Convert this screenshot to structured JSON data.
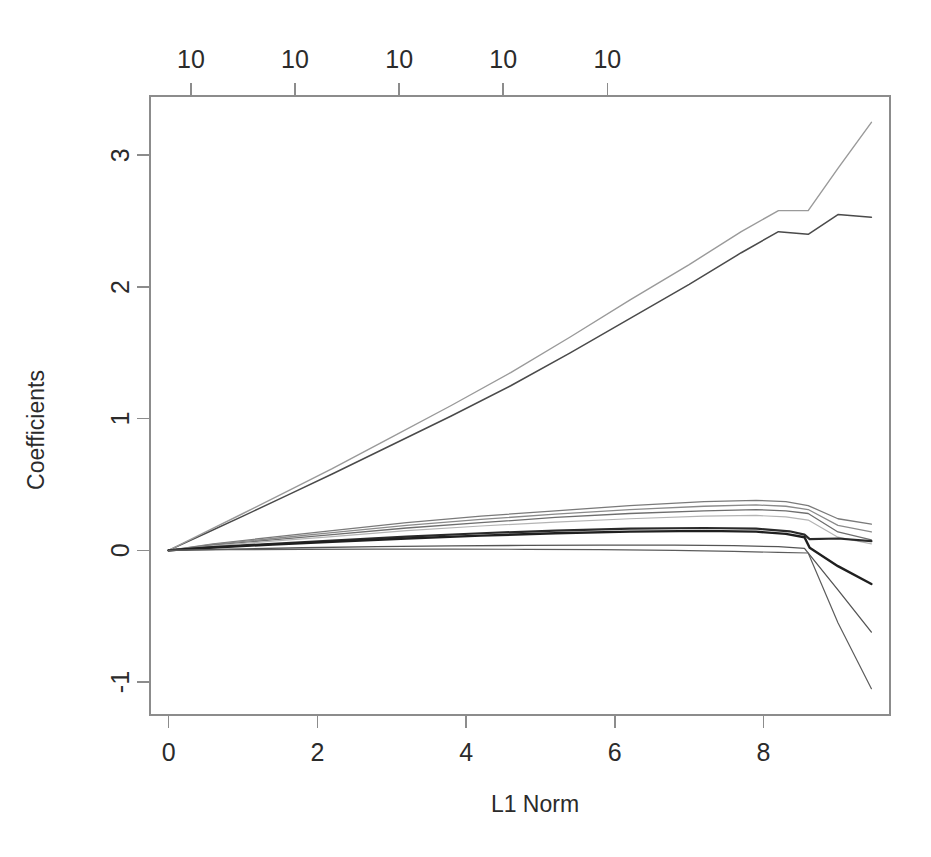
{
  "figure": {
    "background_color": "#ffffff",
    "frame_color": "#8c8c8c",
    "width": 931,
    "height": 857
  },
  "axes": {
    "left_title": "Coefficients",
    "bottom_title": "L1 Norm",
    "top_title": "",
    "y_ticks": [
      "-1",
      "0",
      "1",
      "2",
      "3"
    ],
    "x_ticks": [
      "0",
      "2",
      "4",
      "6",
      "8"
    ],
    "top_ticks": [
      "10",
      "10",
      "10",
      "10",
      "10"
    ]
  },
  "chart_data": {
    "type": "line",
    "title": "",
    "subtitle": "",
    "xlabel": "L1 Norm",
    "ylabel": "Coefficients",
    "top_axis_label": "",
    "top_axis_ticks": [
      10,
      10,
      10,
      10,
      10
    ],
    "top_axis_tick_positions": [
      0.3,
      1.7,
      3.1,
      4.5,
      5.9
    ],
    "xlim": [
      -0.25,
      9.7
    ],
    "ylim": [
      -1.25,
      3.45
    ],
    "xticks": [
      0,
      2,
      4,
      6,
      8
    ],
    "yticks": [
      -1,
      0,
      1,
      2,
      3
    ],
    "grid": false,
    "legend": false,
    "legend_position": "none",
    "annotations": [],
    "breakpoint_x": 8.6,
    "series": [
      {
        "name": "coef-1",
        "color": "#4a4a4a",
        "width": 1.5,
        "x": [
          0.0,
          0.5,
          1.0,
          1.6,
          2.2,
          3.0,
          3.8,
          4.6,
          5.4,
          6.2,
          7.0,
          7.7,
          8.2,
          8.6,
          9.0,
          9.45
        ],
        "y": [
          0.0,
          0.13,
          0.26,
          0.42,
          0.58,
          0.8,
          1.02,
          1.25,
          1.5,
          1.76,
          2.02,
          2.26,
          2.42,
          2.4,
          2.55,
          2.53
        ]
      },
      {
        "name": "coef-2",
        "color": "#9a9a9a",
        "width": 1.4,
        "x": [
          0.0,
          0.5,
          1.0,
          1.6,
          2.2,
          3.0,
          3.8,
          4.6,
          5.4,
          6.2,
          7.0,
          7.7,
          8.2,
          8.6,
          9.0,
          9.45
        ],
        "y": [
          0.0,
          0.14,
          0.28,
          0.45,
          0.62,
          0.86,
          1.1,
          1.35,
          1.62,
          1.9,
          2.17,
          2.42,
          2.58,
          2.58,
          2.9,
          3.25
        ]
      },
      {
        "name": "coef-3",
        "color": "#7a7a7a",
        "width": 1.3,
        "x": [
          0.0,
          0.6,
          1.4,
          2.2,
          3.2,
          4.2,
          5.2,
          6.2,
          7.2,
          7.9,
          8.3,
          8.6,
          9.0,
          9.45
        ],
        "y": [
          0.0,
          0.05,
          0.1,
          0.15,
          0.21,
          0.26,
          0.3,
          0.34,
          0.37,
          0.38,
          0.37,
          0.34,
          0.24,
          0.2
        ]
      },
      {
        "name": "coef-4",
        "color": "#8a8a8a",
        "width": 1.3,
        "x": [
          0.0,
          0.6,
          1.4,
          2.2,
          3.2,
          4.2,
          5.2,
          6.2,
          7.2,
          7.9,
          8.3,
          8.6,
          9.0,
          9.45
        ],
        "y": [
          0.0,
          0.045,
          0.09,
          0.135,
          0.19,
          0.235,
          0.275,
          0.31,
          0.335,
          0.345,
          0.335,
          0.31,
          0.19,
          0.14
        ]
      },
      {
        "name": "coef-5",
        "color": "#6e6e6e",
        "width": 1.3,
        "x": [
          0.0,
          0.6,
          1.4,
          2.2,
          3.2,
          4.2,
          5.2,
          6.2,
          7.2,
          7.9,
          8.3,
          8.6,
          9.0,
          9.45
        ],
        "y": [
          0.0,
          0.04,
          0.08,
          0.12,
          0.17,
          0.21,
          0.25,
          0.28,
          0.3,
          0.31,
          0.3,
          0.28,
          0.14,
          0.08
        ]
      },
      {
        "name": "coef-6",
        "color": "#b4b4b4",
        "width": 1.2,
        "x": [
          0.0,
          0.6,
          1.4,
          2.2,
          3.2,
          4.2,
          5.2,
          6.2,
          7.2,
          7.9,
          8.3,
          8.6,
          9.0,
          9.45
        ],
        "y": [
          0.0,
          0.035,
          0.07,
          0.105,
          0.15,
          0.185,
          0.215,
          0.24,
          0.26,
          0.265,
          0.255,
          0.23,
          0.1,
          0.05
        ]
      },
      {
        "name": "coef-7",
        "color": "#2a2a2a",
        "width": 2.2,
        "x": [
          0.0,
          0.6,
          1.4,
          2.2,
          3.2,
          4.2,
          5.2,
          6.2,
          7.2,
          7.9,
          8.35,
          8.55,
          8.62,
          9.0,
          9.45
        ],
        "y": [
          0.0,
          0.025,
          0.05,
          0.075,
          0.105,
          0.13,
          0.15,
          0.165,
          0.17,
          0.165,
          0.145,
          0.12,
          0.085,
          0.09,
          0.07
        ]
      },
      {
        "name": "coef-8",
        "color": "#1f1f1f",
        "width": 2.4,
        "x": [
          0.0,
          0.6,
          1.4,
          2.2,
          3.2,
          4.2,
          5.2,
          6.2,
          7.2,
          7.9,
          8.3,
          8.55,
          8.62,
          9.0,
          9.45
        ],
        "y": [
          0.0,
          0.022,
          0.044,
          0.066,
          0.09,
          0.112,
          0.13,
          0.142,
          0.148,
          0.142,
          0.125,
          0.1,
          0.02,
          -0.12,
          -0.255
        ]
      },
      {
        "name": "coef-9",
        "color": "#545454",
        "width": 1.3,
        "x": [
          0.0,
          0.8,
          1.8,
          2.8,
          3.8,
          4.8,
          5.8,
          6.8,
          7.6,
          8.2,
          8.55,
          9.0,
          9.45
        ],
        "y": [
          0.0,
          0.01,
          0.02,
          0.028,
          0.034,
          0.038,
          0.04,
          0.04,
          0.036,
          0.028,
          0.015,
          -0.3,
          -0.62
        ]
      },
      {
        "name": "coef-10",
        "color": "#5c5c5c",
        "width": 1.2,
        "x": [
          0.0,
          0.8,
          1.8,
          2.8,
          3.8,
          4.8,
          5.8,
          6.8,
          7.6,
          8.2,
          8.6,
          9.0,
          9.45
        ],
        "y": [
          0.0,
          0.005,
          0.008,
          0.01,
          0.01,
          0.008,
          0.005,
          0.0,
          -0.008,
          -0.015,
          -0.02,
          -0.55,
          -1.05
        ]
      }
    ]
  }
}
